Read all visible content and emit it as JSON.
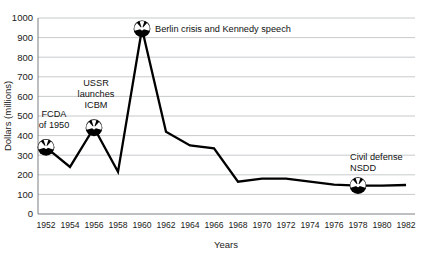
{
  "chart_data": {
    "type": "line",
    "title": "",
    "xlabel": "Years",
    "ylabel": "Dollars (millions)",
    "xlim": [
      1951,
      1983
    ],
    "ylim": [
      0,
      1000
    ],
    "grid": true,
    "legend": "none",
    "x": [
      1952,
      1954,
      1956,
      1958,
      1960,
      1962,
      1964,
      1966,
      1968,
      1970,
      1972,
      1974,
      1976,
      1978,
      1980,
      1982
    ],
    "values": [
      340,
      240,
      440,
      215,
      945,
      420,
      350,
      335,
      165,
      180,
      180,
      165,
      150,
      145,
      145,
      148
    ],
    "xticks": [
      "1952",
      "1954",
      "1956",
      "1958",
      "1960",
      "1962",
      "1964",
      "1966",
      "1968",
      "1970",
      "1972",
      "1974",
      "1976",
      "1978",
      "1980",
      "1982"
    ],
    "yticks": [
      "0",
      "100",
      "200",
      "300",
      "400",
      "500",
      "600",
      "700",
      "800",
      "900",
      "1000"
    ],
    "ytick_values": [
      0,
      100,
      200,
      300,
      400,
      500,
      600,
      700,
      800,
      900,
      1000
    ],
    "annotations": [
      {
        "label": "FCDA\nof 1950",
        "lines": [
          "FCDA",
          "of 1950"
        ],
        "x": 1952,
        "y": 340,
        "marker": "radiation-trefoil"
      },
      {
        "label": "USSR\nlaunches\nICBM",
        "lines": [
          "USSR",
          "launches",
          "ICBM"
        ],
        "x": 1956,
        "y": 440,
        "marker": "radiation-trefoil"
      },
      {
        "label": "Berlin crisis and Kennedy speech",
        "lines": [
          "Berlin crisis and Kennedy speech"
        ],
        "x": 1960,
        "y": 945,
        "marker": "radiation-trefoil"
      },
      {
        "label": "Civil defense\nNSDD",
        "lines": [
          "Civil defense",
          "NSDD"
        ],
        "x": 1978,
        "y": 145,
        "marker": "radiation-trefoil"
      }
    ],
    "colors": {
      "line": "#000000",
      "grid": "#b9bcbe",
      "axis": "#6e7174",
      "text": "#1a1a1a",
      "marker": "#000000",
      "background": "#ffffff"
    }
  }
}
